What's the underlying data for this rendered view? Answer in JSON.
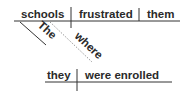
{
  "diagram": {
    "type": "sentence-diagram",
    "main_clause": {
      "subject": "schools",
      "verb": "frustrated",
      "object": "them",
      "modifiers": [
        {
          "word": "The",
          "modifies": "schools"
        }
      ]
    },
    "relative_clause": {
      "connector": "where",
      "subject": "they",
      "verb": "were enrolled"
    }
  },
  "colors": {
    "text": "#2a2a2a",
    "line": "#333333",
    "dashed_line": "#999999",
    "background": "#ffffff"
  }
}
